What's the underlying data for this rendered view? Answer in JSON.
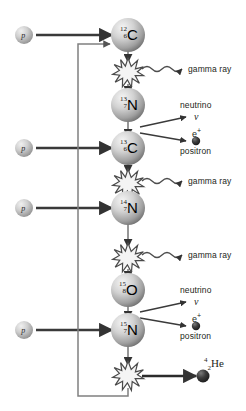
{
  "diagram": {
    "colors": {
      "line": "#4d4d4d",
      "arrow": "#333333",
      "text": "#231f20",
      "burst_fill": "#f2f2f2",
      "burst_stroke": "#4d4d4d",
      "sphere_light": "#e8e8e8",
      "sphere_dark": "#8a8a8a",
      "particle_dark": "#2b2b2b"
    },
    "inputs": [
      {
        "id": "proton-1",
        "label": "p",
        "x": 24,
        "y": 35
      },
      {
        "id": "proton-2",
        "label": "p",
        "x": 24,
        "y": 148
      },
      {
        "id": "proton-3",
        "label": "p",
        "x": 24,
        "y": 208
      },
      {
        "id": "proton-4",
        "label": "p",
        "x": 24,
        "y": 330
      }
    ],
    "nuclei": [
      {
        "id": "carbon-12",
        "mass": "12",
        "charge": "6",
        "element": "C",
        "x": 128,
        "y": 35
      },
      {
        "id": "nitrogen-13",
        "mass": "13",
        "charge": "7",
        "element": "N",
        "x": 128,
        "y": 105
      },
      {
        "id": "carbon-13",
        "mass": "13",
        "charge": "6",
        "element": "C",
        "x": 128,
        "y": 148
      },
      {
        "id": "nitrogen-14",
        "mass": "14",
        "charge": "7",
        "element": "N",
        "x": 128,
        "y": 208
      },
      {
        "id": "oxygen-15",
        "mass": "15",
        "charge": "8",
        "element": "O",
        "x": 128,
        "y": 290
      },
      {
        "id": "nitrogen-15",
        "mass": "15",
        "charge": "7",
        "element": "N",
        "x": 128,
        "y": 330
      }
    ],
    "bursts": [
      {
        "id": "burst-1",
        "x": 128,
        "y": 73
      },
      {
        "id": "burst-2",
        "x": 128,
        "y": 184
      },
      {
        "id": "burst-3",
        "x": 128,
        "y": 258
      },
      {
        "id": "burst-4",
        "x": 128,
        "y": 376
      }
    ],
    "emissions": [
      {
        "id": "gamma-1",
        "label": "gamma ray",
        "x": 188,
        "y": 69
      },
      {
        "id": "gamma-2",
        "label": "gamma ray",
        "x": 188,
        "y": 181
      },
      {
        "id": "gamma-3",
        "label": "gamma ray",
        "x": 188,
        "y": 255
      }
    ],
    "decays": [
      {
        "id": "decay-1",
        "neutrino_label": "neutrino",
        "neutrino_symbol": "ν",
        "positron_label": "positron",
        "positron_symbol": "e",
        "positron_sup": "+",
        "y": 120
      },
      {
        "id": "decay-2",
        "neutrino_label": "neutrino",
        "neutrino_symbol": "ν",
        "positron_label": "positron",
        "positron_symbol": "e",
        "positron_sup": "+",
        "y": 305
      }
    ],
    "product": {
      "id": "helium-4",
      "mass": "4",
      "charge": "2",
      "element": "He",
      "x": 212,
      "y": 366
    }
  }
}
